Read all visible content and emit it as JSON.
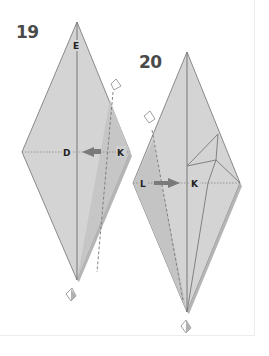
{
  "diagram": {
    "type": "origami instructions",
    "steps": [
      {
        "number": "19",
        "labels": {
          "top": "E",
          "center": "D",
          "right": "K"
        },
        "fold": "valley fold right flap toward center (K to D)"
      },
      {
        "number": "20",
        "labels": {
          "left": "L",
          "center": "K"
        },
        "fold": "valley fold left flap toward center (L to K)"
      }
    ],
    "colors": {
      "paper": "#d3d3d3",
      "paper_shade": "#c4c4c4",
      "edge": "#8a8a8a",
      "text": "#4a4a4a"
    }
  }
}
